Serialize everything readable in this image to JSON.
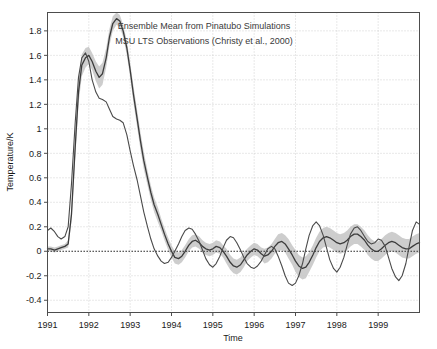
{
  "chart_data": {
    "type": "line",
    "title": "",
    "xlabel": "Time",
    "ylabel": "Temperature/K",
    "xlim": [
      1991.0,
      2000.0
    ],
    "ylim": [
      -0.5,
      1.95
    ],
    "grid": true,
    "grid_style": "dotted",
    "zero_line": true,
    "legend_position": "top-center",
    "xticks": [
      1991,
      1992,
      1993,
      1994,
      1995,
      1996,
      1997,
      1998,
      1999
    ],
    "xticklabels": [
      "1991",
      "1992",
      "1993",
      "1994",
      "1995",
      "1996",
      "1997",
      "1998",
      "1999"
    ],
    "yticks": [
      -0.4,
      -0.2,
      0,
      0.2,
      0.4,
      0.6,
      0.8,
      1,
      1.2,
      1.4,
      1.6,
      1.8
    ],
    "yticklabels": [
      "-0.4",
      "-0.2",
      "0",
      "0.2",
      "0.4",
      "0.6",
      "0.8",
      "1",
      "1.2",
      "1.4",
      "1.6",
      "1.8"
    ],
    "series": [
      {
        "name": "Ensemble Mean from Pinatubo Simulations",
        "color": "#3c3c3c",
        "band_color": "#c4c4c4",
        "has_band": true,
        "x": [
          1991.0,
          1991.08,
          1991.17,
          1991.25,
          1991.33,
          1991.42,
          1991.5,
          1991.58,
          1991.67,
          1991.75,
          1991.83,
          1991.92,
          1992.0,
          1992.08,
          1992.17,
          1992.25,
          1992.33,
          1992.42,
          1992.5,
          1992.58,
          1992.67,
          1992.75,
          1992.83,
          1992.92,
          1993.0,
          1993.08,
          1993.17,
          1993.25,
          1993.33,
          1993.42,
          1993.5,
          1993.58,
          1993.67,
          1993.75,
          1993.83,
          1993.92,
          1994.0,
          1994.08,
          1994.17,
          1994.25,
          1994.33,
          1994.42,
          1994.5,
          1994.58,
          1994.67,
          1994.75,
          1994.83,
          1994.92,
          1995.0,
          1995.08,
          1995.17,
          1995.25,
          1995.33,
          1995.42,
          1995.5,
          1995.58,
          1995.67,
          1995.75,
          1995.83,
          1995.92,
          1996.0,
          1996.08,
          1996.17,
          1996.25,
          1996.33,
          1996.42,
          1996.5,
          1996.58,
          1996.67,
          1996.75,
          1996.83,
          1996.92,
          1997.0,
          1997.08,
          1997.17,
          1997.25,
          1997.33,
          1997.42,
          1997.5,
          1997.58,
          1997.67,
          1997.75,
          1997.83,
          1997.92,
          1998.0,
          1998.08,
          1998.17,
          1998.25,
          1998.33,
          1998.42,
          1998.5,
          1998.58,
          1998.67,
          1998.75,
          1998.83,
          1998.92,
          1999.0,
          1999.08,
          1999.17,
          1999.25,
          1999.33,
          1999.42,
          1999.5,
          1999.58,
          1999.67,
          1999.75,
          1999.83,
          1999.92,
          2000.0
        ],
        "y": [
          0.02,
          0.02,
          0.01,
          0.02,
          0.03,
          0.04,
          0.06,
          0.3,
          0.85,
          1.3,
          1.52,
          1.58,
          1.6,
          1.55,
          1.47,
          1.42,
          1.45,
          1.58,
          1.75,
          1.86,
          1.9,
          1.88,
          1.8,
          1.66,
          1.48,
          1.28,
          1.08,
          0.9,
          0.74,
          0.6,
          0.48,
          0.38,
          0.3,
          0.22,
          0.14,
          0.06,
          0.0,
          -0.05,
          -0.06,
          -0.04,
          0.0,
          0.05,
          0.08,
          0.09,
          0.07,
          0.04,
          0.02,
          0.01,
          0.02,
          0.04,
          0.03,
          0.0,
          -0.04,
          -0.09,
          -0.12,
          -0.13,
          -0.11,
          -0.07,
          -0.03,
          0.0,
          0.02,
          0.01,
          -0.02,
          -0.04,
          -0.03,
          0.0,
          0.04,
          0.07,
          0.08,
          0.06,
          0.02,
          -0.03,
          -0.08,
          -0.12,
          -0.14,
          -0.13,
          -0.09,
          -0.03,
          0.03,
          0.08,
          0.11,
          0.12,
          0.11,
          0.09,
          0.07,
          0.06,
          0.07,
          0.09,
          0.12,
          0.14,
          0.14,
          0.12,
          0.09,
          0.05,
          0.02,
          0.0,
          0.0,
          0.02,
          0.05,
          0.07,
          0.08,
          0.07,
          0.05,
          0.03,
          0.02,
          0.02,
          0.04,
          0.06,
          0.07
        ],
        "band_halfwidth": [
          0.02,
          0.02,
          0.02,
          0.02,
          0.02,
          0.02,
          0.03,
          0.06,
          0.09,
          0.1,
          0.09,
          0.08,
          0.07,
          0.07,
          0.08,
          0.09,
          0.09,
          0.08,
          0.07,
          0.06,
          0.05,
          0.05,
          0.05,
          0.06,
          0.06,
          0.07,
          0.07,
          0.07,
          0.07,
          0.06,
          0.06,
          0.06,
          0.06,
          0.05,
          0.05,
          0.05,
          0.05,
          0.05,
          0.05,
          0.05,
          0.05,
          0.05,
          0.05,
          0.05,
          0.05,
          0.05,
          0.05,
          0.05,
          0.05,
          0.05,
          0.05,
          0.05,
          0.06,
          0.06,
          0.06,
          0.06,
          0.06,
          0.06,
          0.05,
          0.05,
          0.05,
          0.05,
          0.05,
          0.06,
          0.06,
          0.06,
          0.06,
          0.07,
          0.07,
          0.07,
          0.08,
          0.08,
          0.09,
          0.09,
          0.09,
          0.09,
          0.08,
          0.08,
          0.08,
          0.08,
          0.08,
          0.08,
          0.08,
          0.08,
          0.08,
          0.08,
          0.08,
          0.08,
          0.08,
          0.08,
          0.08,
          0.08,
          0.08,
          0.08,
          0.08,
          0.08,
          0.08,
          0.08,
          0.08,
          0.08,
          0.08,
          0.08,
          0.08,
          0.08,
          0.08,
          0.08,
          0.08,
          0.08,
          0.08
        ]
      },
      {
        "name": "MSU LTS Observations (Christy et al., 2000)",
        "color": "#4a4a4a",
        "has_band": false,
        "x": [
          1991.0,
          1991.08,
          1991.17,
          1991.25,
          1991.33,
          1991.42,
          1991.5,
          1991.58,
          1991.67,
          1991.75,
          1991.83,
          1991.92,
          1992.0,
          1992.08,
          1992.17,
          1992.25,
          1992.33,
          1992.42,
          1992.5,
          1992.58,
          1992.67,
          1992.75,
          1992.83,
          1992.92,
          1993.0,
          1993.08,
          1993.17,
          1993.25,
          1993.33,
          1993.42,
          1993.5,
          1993.58,
          1993.67,
          1993.75,
          1993.83,
          1993.92,
          1994.0,
          1994.08,
          1994.17,
          1994.25,
          1994.33,
          1994.42,
          1994.5,
          1994.58,
          1994.67,
          1994.75,
          1994.83,
          1994.92,
          1995.0,
          1995.08,
          1995.17,
          1995.25,
          1995.33,
          1995.42,
          1995.5,
          1995.58,
          1995.67,
          1995.75,
          1995.83,
          1995.92,
          1996.0,
          1996.08,
          1996.17,
          1996.25,
          1996.33,
          1996.42,
          1996.5,
          1996.58,
          1996.67,
          1996.75,
          1996.83,
          1996.92,
          1997.0,
          1997.08,
          1997.17,
          1997.25,
          1997.33,
          1997.42,
          1997.5,
          1997.58,
          1997.67,
          1997.75,
          1997.83,
          1997.92,
          1998.0,
          1998.08,
          1998.17,
          1998.25,
          1998.33,
          1998.42,
          1998.5,
          1998.58,
          1998.67,
          1998.75,
          1998.83,
          1998.92,
          1999.0,
          1999.08,
          1999.17,
          1999.25,
          1999.33,
          1999.42,
          1999.5,
          1999.58,
          1999.67,
          1999.75,
          1999.83,
          1999.92,
          2000.0
        ],
        "y": [
          0.17,
          0.19,
          0.16,
          0.12,
          0.1,
          0.12,
          0.2,
          0.55,
          1.05,
          1.42,
          1.58,
          1.62,
          1.55,
          1.4,
          1.3,
          1.25,
          1.24,
          1.22,
          1.16,
          1.1,
          1.08,
          1.07,
          1.05,
          0.95,
          0.82,
          0.7,
          0.58,
          0.45,
          0.32,
          0.2,
          0.1,
          0.02,
          -0.04,
          -0.08,
          -0.1,
          -0.09,
          -0.05,
          0.0,
          0.06,
          0.12,
          0.17,
          0.19,
          0.18,
          0.14,
          0.08,
          0.01,
          -0.06,
          -0.11,
          -0.13,
          -0.1,
          -0.04,
          0.03,
          0.09,
          0.12,
          0.11,
          0.07,
          0.01,
          -0.05,
          -0.1,
          -0.13,
          -0.14,
          -0.12,
          -0.08,
          -0.03,
          0.02,
          0.04,
          0.02,
          -0.04,
          -0.12,
          -0.2,
          -0.26,
          -0.28,
          -0.26,
          -0.2,
          -0.1,
          0.02,
          0.13,
          0.21,
          0.24,
          0.21,
          0.13,
          0.03,
          -0.07,
          -0.14,
          -0.17,
          -0.13,
          -0.05,
          0.05,
          0.14,
          0.19,
          0.2,
          0.17,
          0.12,
          0.08,
          0.06,
          0.07,
          0.1,
          0.09,
          0.04,
          -0.05,
          -0.14,
          -0.21,
          -0.24,
          -0.2,
          -0.1,
          0.04,
          0.17,
          0.24,
          0.22
        ]
      }
    ]
  },
  "legend": {
    "entries": [
      {
        "label": "Ensemble Mean from Pinatubo Simulations"
      },
      {
        "label": "MSU LTS Observations (Christy et al., 2000)"
      }
    ]
  }
}
